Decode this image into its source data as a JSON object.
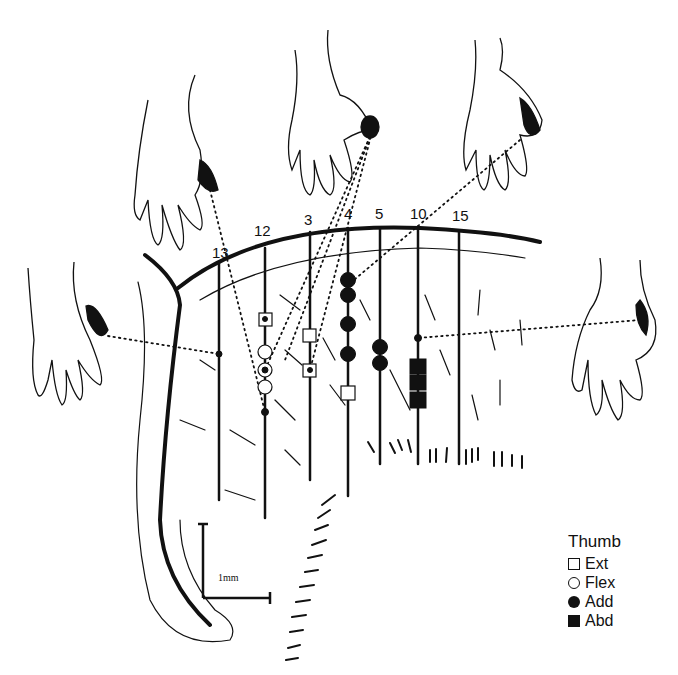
{
  "figure": {
    "track_labels": [
      {
        "id": "13",
        "x": 226,
        "y": 258
      },
      {
        "id": "12",
        "x": 264,
        "y": 236
      },
      {
        "id": "3",
        "x": 309,
        "y": 224
      },
      {
        "id": "4",
        "x": 348,
        "y": 218
      },
      {
        "id": "5",
        "x": 380,
        "y": 218
      },
      {
        "id": "10",
        "x": 418,
        "y": 218
      },
      {
        "id": "15",
        "x": 459,
        "y": 220
      }
    ],
    "scale_bar": {
      "label": "1mm"
    },
    "legend": {
      "title": "Thumb",
      "items": [
        {
          "symbol": "open-square",
          "label": "Ext"
        },
        {
          "symbol": "open-circle",
          "label": "Flex"
        },
        {
          "symbol": "filled-circle",
          "label": "Add"
        },
        {
          "symbol": "filled-square",
          "label": "Abd"
        }
      ]
    },
    "hands": [
      {
        "position": "left",
        "highlight": "thumb tip",
        "linked_track": "13"
      },
      {
        "position": "upper-left",
        "highlight": "thumb tip",
        "linked_track": "12"
      },
      {
        "position": "top-center",
        "highlight": "thumb tip",
        "linked_track": "3"
      },
      {
        "position": "upper-right",
        "highlight": "thumb base",
        "linked_track": "4"
      },
      {
        "position": "right",
        "highlight": "thenar",
        "linked_track": "10"
      }
    ],
    "colors": {
      "ink": "#111111",
      "background": "#ffffff"
    }
  }
}
